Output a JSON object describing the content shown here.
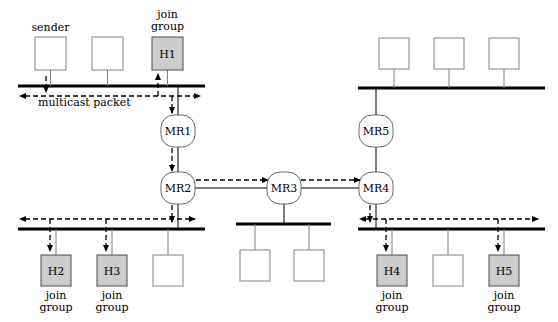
{
  "figure": {
    "colors": {
      "line": "#000000",
      "bus": "#000000",
      "host_fill": "#ffffff",
      "host_stroke": "#808080",
      "member_fill": "#cccccc",
      "member_stroke": "#4d4d4d",
      "router_fill": "#ffffff",
      "router_stroke": "#666666",
      "dashed": "#000000",
      "background": "#ffffff"
    }
  },
  "annotations": {
    "sender_label": "sender",
    "multicast_packet_label": "multicast packet",
    "join_group_line1": "join",
    "join_group_line2": "group"
  },
  "segments": [
    {
      "name": "top-left-lan",
      "x1": 18,
      "x2": 205,
      "y": 86
    },
    {
      "name": "top-right-lan",
      "x1": 358,
      "x2": 545,
      "y": 88
    },
    {
      "name": "bottom-left-lan",
      "x1": 18,
      "x2": 205,
      "y": 229
    },
    {
      "name": "bottom-mid-lan",
      "x1": 236,
      "x2": 331,
      "y": 224
    },
    {
      "name": "bottom-right-lan",
      "x1": 358,
      "x2": 545,
      "y": 229
    }
  ],
  "hosts": [
    {
      "id": "sender-host",
      "label": "",
      "caption": "sender",
      "member": false,
      "x": 35,
      "y": 37,
      "w": 31,
      "h": 33,
      "lan": "top-left-lan"
    },
    {
      "id": "top-left-host-2",
      "label": "",
      "caption": "",
      "member": false,
      "x": 92,
      "y": 37,
      "w": 31,
      "h": 33,
      "lan": "top-left-lan"
    },
    {
      "id": "host-h1",
      "label": "H1",
      "caption": "join group",
      "member": true,
      "x": 152,
      "y": 37,
      "w": 31,
      "h": 33,
      "lan": "top-left-lan"
    },
    {
      "id": "top-right-host-1",
      "label": "",
      "caption": "",
      "member": false,
      "x": 379,
      "y": 38,
      "w": 30,
      "h": 31,
      "lan": "top-right-lan"
    },
    {
      "id": "top-right-host-2",
      "label": "",
      "caption": "",
      "member": false,
      "x": 434,
      "y": 38,
      "w": 30,
      "h": 31,
      "lan": "top-right-lan"
    },
    {
      "id": "top-right-host-3",
      "label": "",
      "caption": "",
      "member": false,
      "x": 489,
      "y": 38,
      "w": 30,
      "h": 31,
      "lan": "top-right-lan"
    },
    {
      "id": "host-h2",
      "label": "H2",
      "caption": "join group",
      "member": true,
      "x": 41,
      "y": 255,
      "w": 30,
      "h": 31,
      "lan": "bottom-left-lan"
    },
    {
      "id": "host-h3",
      "label": "H3",
      "caption": "join group",
      "member": true,
      "x": 97,
      "y": 255,
      "w": 30,
      "h": 31,
      "lan": "bottom-left-lan"
    },
    {
      "id": "bottom-left-host-3",
      "label": "",
      "caption": "",
      "member": false,
      "x": 153,
      "y": 255,
      "w": 30,
      "h": 31,
      "lan": "bottom-left-lan"
    },
    {
      "id": "bottom-mid-host-1",
      "label": "",
      "caption": "",
      "member": false,
      "x": 240,
      "y": 250,
      "w": 30,
      "h": 31,
      "lan": "bottom-mid-lan"
    },
    {
      "id": "bottom-mid-host-2",
      "label": "",
      "caption": "",
      "member": false,
      "x": 294,
      "y": 250,
      "w": 30,
      "h": 31,
      "lan": "bottom-mid-lan"
    },
    {
      "id": "host-h4",
      "label": "H4",
      "caption": "join group",
      "member": true,
      "x": 377,
      "y": 255,
      "w": 30,
      "h": 31,
      "lan": "bottom-right-lan"
    },
    {
      "id": "bottom-right-host-2",
      "label": "",
      "caption": "",
      "member": false,
      "x": 433,
      "y": 255,
      "w": 30,
      "h": 31,
      "lan": "bottom-right-lan"
    },
    {
      "id": "host-h5",
      "label": "H5",
      "caption": "join group",
      "member": true,
      "x": 489,
      "y": 255,
      "w": 30,
      "h": 31,
      "lan": "bottom-right-lan"
    }
  ],
  "routers": [
    {
      "id": "router-mr1",
      "label": "MR1",
      "cx": 178,
      "cy": 131,
      "rx": 17,
      "ry": 16
    },
    {
      "id": "router-mr2",
      "label": "MR2",
      "cx": 178,
      "cy": 188,
      "rx": 17,
      "ry": 16
    },
    {
      "id": "router-mr3",
      "label": "MR3",
      "cx": 284,
      "cy": 188,
      "rx": 17,
      "ry": 16
    },
    {
      "id": "router-mr4",
      "label": "MR4",
      "cx": 376,
      "cy": 188,
      "rx": 17,
      "ry": 16
    },
    {
      "id": "router-mr5",
      "label": "MR5",
      "cx": 376,
      "cy": 131,
      "rx": 17,
      "ry": 16
    }
  ],
  "links": [
    {
      "name": "mr1-mr2-link",
      "x1": 178,
      "y1": 147,
      "x2": 178,
      "y2": 172
    },
    {
      "name": "mr1-toplan-link",
      "x1": 178,
      "y1": 86,
      "x2": 178,
      "y2": 115
    },
    {
      "name": "mr2-bottomlan-link",
      "x1": 178,
      "y1": 204,
      "x2": 178,
      "y2": 229
    },
    {
      "name": "mr2-mr3-link",
      "x1": 195,
      "y1": 188,
      "x2": 267,
      "y2": 188
    },
    {
      "name": "mr3-mr4-link",
      "x1": 301,
      "y1": 188,
      "x2": 359,
      "y2": 188
    },
    {
      "name": "mr3-midlan-link",
      "x1": 284,
      "y1": 204,
      "x2": 284,
      "y2": 224
    },
    {
      "name": "mr4-mr5-link",
      "x1": 376,
      "y1": 147,
      "x2": 376,
      "y2": 172
    },
    {
      "name": "mr5-toplan-link",
      "x1": 376,
      "y1": 88,
      "x2": 376,
      "y2": 115
    },
    {
      "name": "mr4-bottomlan-link",
      "x1": 376,
      "y1": 204,
      "x2": 376,
      "y2": 229
    }
  ],
  "packet_flows": [
    {
      "name": "flow-top-lan-horizontal",
      "points": "25,96 200,96",
      "arrow_start": true,
      "arrow_end": true
    },
    {
      "name": "flow-sender-drop",
      "points": "46,76 46,92",
      "arrow_start": false,
      "arrow_end": true
    },
    {
      "name": "flow-h1-join-up",
      "points": "158,96 158,74",
      "arrow_start": false,
      "arrow_end": true
    },
    {
      "name": "flow-to-mr1",
      "points": "172,96 172,113",
      "arrow_start": false,
      "arrow_end": true
    },
    {
      "name": "flow-mr1-to-mr2",
      "points": "172,148 172,171",
      "arrow_start": false,
      "arrow_end": true
    },
    {
      "name": "flow-mr2-down",
      "points": "172,205 172,222",
      "arrow_start": false,
      "arrow_end": true
    },
    {
      "name": "flow-bottom-left-horizontal",
      "points": "25,219 195,219",
      "arrow_start": true,
      "arrow_end": true
    },
    {
      "name": "flow-h2-drop",
      "points": "50,219 50,251",
      "arrow_start": false,
      "arrow_end": true
    },
    {
      "name": "flow-h3-drop",
      "points": "106,219 106,251",
      "arrow_start": false,
      "arrow_end": true
    },
    {
      "name": "flow-mr2-to-mr3",
      "points": "196,180 268,180",
      "arrow_start": false,
      "arrow_end": true
    },
    {
      "name": "flow-mr3-to-mr4",
      "points": "301,180 360,180",
      "arrow_start": false,
      "arrow_end": true
    },
    {
      "name": "flow-mr4-down",
      "points": "370,205 370,222",
      "arrow_start": false,
      "arrow_end": true
    },
    {
      "name": "flow-bottom-right-horizontal",
      "points": "365,219 538,219",
      "arrow_start": true,
      "arrow_end": true
    },
    {
      "name": "flow-h4-drop",
      "points": "386,219 386,251",
      "arrow_start": false,
      "arrow_end": true
    },
    {
      "name": "flow-h5-drop",
      "points": "498,219 498,251",
      "arrow_start": false,
      "arrow_end": true
    }
  ]
}
